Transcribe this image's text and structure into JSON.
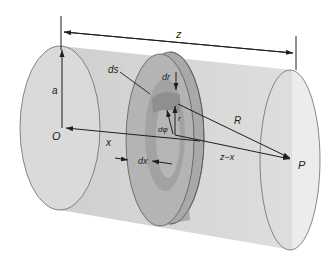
{
  "figure": {
    "labels": {
      "z": "z",
      "a": "a",
      "O": "O",
      "x": "x",
      "ds": "ds",
      "dr": "dr",
      "r": "r",
      "dphi": "dφ",
      "dx": "dx",
      "R": "R",
      "z_minus_x": "z−x",
      "P": "P"
    },
    "colors": {
      "cylinder_fill": "#d6d6d6",
      "end_cap_fill": "#dcdcdc",
      "disk_rim": "#9a9a9a",
      "disk_face": "#b3b3b3",
      "ring_inner": "#a4a4a4",
      "element_ds": "#8e8e8e",
      "outline": "#5a5a5a",
      "line": "#1e1e1e"
    }
  }
}
